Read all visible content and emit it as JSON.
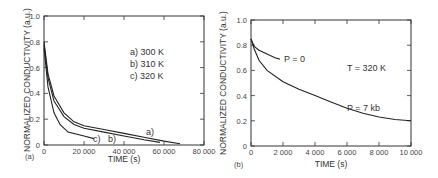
{
  "chart_data": [
    {
      "panel": "(a)",
      "type": "line",
      "xlabel": "TIME (s)",
      "ylabel": "NORMALIZED CONDUCTIVITY (a.u.)",
      "xlim": [
        0,
        80000
      ],
      "ylim": [
        0,
        1.0
      ],
      "xticks": [
        "0",
        "20 000",
        "40 000",
        "60 000",
        "80 000"
      ],
      "yticks": [
        "0",
        "0.2",
        "0.4",
        "0.6",
        "0.8",
        "1.0"
      ],
      "legend": [
        "a) 300 K",
        "b) 310 K",
        "c) 320 K"
      ],
      "series": [
        {
          "name": "a) 300 K",
          "x": [
            0,
            2000,
            5000,
            10000,
            15000,
            20000,
            30000,
            40000,
            50000,
            60000,
            68000
          ],
          "y": [
            0.8,
            0.55,
            0.38,
            0.25,
            0.18,
            0.15,
            0.12,
            0.09,
            0.06,
            0.03,
            0.01
          ]
        },
        {
          "name": "b) 310 K",
          "x": [
            0,
            2000,
            5000,
            10000,
            15000,
            20000,
            30000,
            40000,
            50000,
            58000
          ],
          "y": [
            0.78,
            0.52,
            0.34,
            0.22,
            0.16,
            0.13,
            0.1,
            0.07,
            0.04,
            0.02
          ]
        },
        {
          "name": "c) 320 K",
          "x": [
            0,
            2000,
            5000,
            8000,
            12000,
            20000,
            25000
          ],
          "y": [
            0.75,
            0.45,
            0.25,
            0.16,
            0.1,
            0.07,
            0.05
          ]
        }
      ],
      "annotations": [
        "a)",
        "b)",
        "c)"
      ],
      "grid": false
    },
    {
      "panel": "(b)",
      "type": "line",
      "xlabel": "TIME (s)",
      "ylabel": "NORMALIZED CONDUCTIVITY (a.u.)",
      "xlim": [
        0,
        10000
      ],
      "ylim": [
        0,
        1.0
      ],
      "xticks": [
        "0",
        "2 000",
        "4 000",
        "6 000",
        "8 000",
        "10 000"
      ],
      "yticks": [
        "0",
        "0.2",
        "0.4",
        "0.6",
        "0.8",
        "1.0"
      ],
      "annotations": [
        "P = 0",
        "T = 320 K",
        "P = 7 kb"
      ],
      "series": [
        {
          "name": "P = 0",
          "x": [
            0,
            200,
            500,
            1000,
            1500,
            1800
          ],
          "y": [
            0.85,
            0.79,
            0.76,
            0.73,
            0.7,
            0.69
          ]
        },
        {
          "name": "P = 7 kb",
          "x": [
            0,
            200,
            500,
            1000,
            2000,
            3000,
            4000,
            5000,
            6000,
            7000,
            8000,
            9000,
            10000
          ],
          "y": [
            0.85,
            0.77,
            0.68,
            0.6,
            0.51,
            0.45,
            0.4,
            0.35,
            0.3,
            0.26,
            0.23,
            0.21,
            0.2
          ]
        }
      ],
      "grid": false
    }
  ],
  "panels": {
    "a": {
      "tag": "(a)",
      "xlabel": "TIME  (s)",
      "ylabel": "NORMALIZED CONDUCTIVITY (a.u.)",
      "legend": [
        "a)  300 K",
        "b)  310 K",
        "c)  320 K"
      ],
      "curve_labels": [
        "a)",
        "b)",
        "c)"
      ]
    },
    "b": {
      "tag": "(b)",
      "xlabel": "TIME  (s)",
      "ylabel": "NORMALIZED CONDUCTIVITY (a.u.)",
      "ann_p0": "P = 0",
      "ann_t": "T = 320 K",
      "ann_p7": "P = 7 kb"
    }
  }
}
